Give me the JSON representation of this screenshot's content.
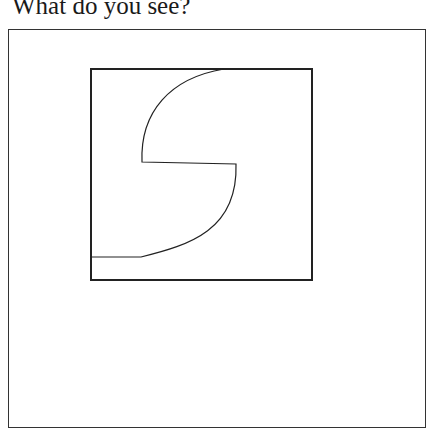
{
  "prompt": {
    "text": "What do you see?"
  },
  "figure": {
    "stroke_color": "#222222"
  }
}
